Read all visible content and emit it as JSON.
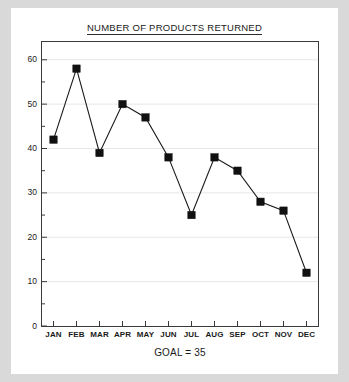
{
  "chart_data": {
    "type": "line",
    "title": "NUMBER OF PRODUCTS RETURNED",
    "xlabel": "GOAL = 35",
    "ylabel": "",
    "categories": [
      "JAN",
      "FEB",
      "MAR",
      "APR",
      "MAY",
      "JUN",
      "JUL",
      "AUG",
      "SEP",
      "OCT",
      "NOV",
      "DEC"
    ],
    "values": [
      42,
      58,
      39,
      50,
      47,
      38,
      25,
      38,
      35,
      28,
      26,
      12
    ],
    "series": [
      {
        "name": "Products returned",
        "values": [
          42,
          58,
          39,
          50,
          47,
          38,
          25,
          38,
          35,
          28,
          26,
          12
        ]
      }
    ],
    "ylim": [
      0,
      64
    ],
    "yticks": [
      0,
      10,
      20,
      30,
      40,
      50,
      60
    ],
    "ytick_labels": [
      "0",
      "10",
      "20",
      "30",
      "40",
      "50",
      "60"
    ],
    "minor_yticks": [
      5,
      15,
      25,
      35,
      45,
      55
    ],
    "grid": true,
    "grid_axis": "y",
    "legend": false,
    "marker": "square",
    "line_color": "#1a1a1a",
    "marker_color": "#111111",
    "grid_color": "#e6e6e6",
    "axis_color": "#3a3a3a",
    "plot_background": "#ffffff",
    "page_background": "#d9d9d9",
    "card_background": "#ffffff",
    "goal_value": 35
  },
  "figure": {
    "title": "NUMBER OF PRODUCTS RETURNED",
    "caption": "GOAL = 35"
  }
}
